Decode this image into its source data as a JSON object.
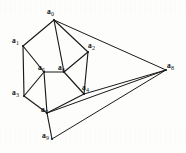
{
  "figure": {
    "type": "graph-diagram",
    "background_color": "#fdfdfc",
    "line_color": "#1a1a1a",
    "label_color": "#111111",
    "width": 186,
    "height": 153
  },
  "vertices": [
    {
      "id": "a0",
      "base": "a",
      "sub": "0",
      "x": 54,
      "y": 20,
      "label_x": 47,
      "label_y": 8
    },
    {
      "id": "a1",
      "base": "a",
      "sub": "1",
      "x": 23,
      "y": 46,
      "label_x": 12,
      "label_y": 37
    },
    {
      "id": "a2",
      "base": "a",
      "sub": "2",
      "x": 88,
      "y": 52,
      "label_x": 88,
      "label_y": 42
    },
    {
      "id": "a3",
      "base": "a",
      "sub": "3",
      "x": 24,
      "y": 96,
      "label_x": 12,
      "label_y": 89
    },
    {
      "id": "a4",
      "base": "a",
      "sub": "4",
      "x": 84,
      "y": 94,
      "label_x": 82,
      "label_y": 84
    },
    {
      "id": "a5",
      "base": "a",
      "sub": "5",
      "x": 44,
      "y": 72,
      "label_x": 38,
      "label_y": 64
    },
    {
      "id": "a6",
      "base": "a",
      "sub": "6",
      "x": 64,
      "y": 72,
      "label_x": 58,
      "label_y": 64
    },
    {
      "id": "a7",
      "base": "a",
      "sub": "7",
      "x": 47,
      "y": 113,
      "label_x": 41,
      "label_y": 106
    },
    {
      "id": "a8",
      "base": "a",
      "sub": "8",
      "x": 166,
      "y": 70,
      "label_x": 167,
      "label_y": 62
    },
    {
      "id": "a9",
      "base": "a",
      "sub": "9",
      "x": 52,
      "y": 139,
      "label_x": 42,
      "label_y": 132
    }
  ],
  "edges": [
    {
      "from": "a0",
      "to": "a1"
    },
    {
      "from": "a0",
      "to": "a2"
    },
    {
      "from": "a0",
      "to": "a6"
    },
    {
      "from": "a0",
      "to": "a8"
    },
    {
      "from": "a1",
      "to": "a3"
    },
    {
      "from": "a1",
      "to": "a5"
    },
    {
      "from": "a2",
      "to": "a4"
    },
    {
      "from": "a2",
      "to": "a6"
    },
    {
      "from": "a3",
      "to": "a5"
    },
    {
      "from": "a3",
      "to": "a7"
    },
    {
      "from": "a4",
      "to": "a6"
    },
    {
      "from": "a4",
      "to": "a7"
    },
    {
      "from": "a4",
      "to": "a8"
    },
    {
      "from": "a5",
      "to": "a6"
    },
    {
      "from": "a5",
      "to": "a7"
    },
    {
      "from": "a7",
      "to": "a8"
    },
    {
      "from": "a7",
      "to": "a9"
    },
    {
      "from": "a9",
      "to": "a8"
    }
  ]
}
